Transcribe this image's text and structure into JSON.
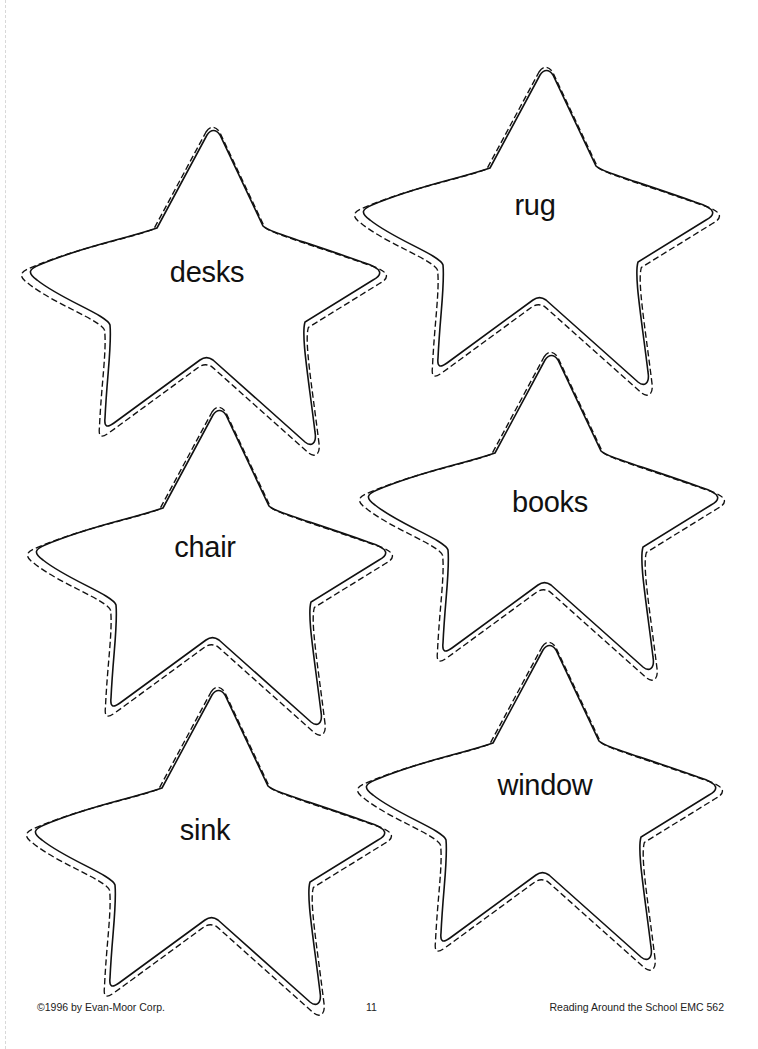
{
  "worksheet": {
    "stars": [
      {
        "word": "desks",
        "tip": [
          207,
          135
        ],
        "label_pos": [
          207,
          272
        ]
      },
      {
        "word": "rug",
        "tip": [
          540,
          75
        ],
        "label_pos": [
          535,
          205
        ]
      },
      {
        "word": "chair",
        "tip": [
          213,
          415
        ],
        "label_pos": [
          205,
          547
        ]
      },
      {
        "word": "books",
        "tip": [
          545,
          360
        ],
        "label_pos": [
          550,
          502
        ]
      },
      {
        "word": "sink",
        "tip": [
          212,
          695
        ],
        "label_pos": [
          205,
          830
        ]
      },
      {
        "word": "window",
        "tip": [
          543,
          650
        ],
        "label_pos": [
          545,
          785
        ]
      }
    ]
  },
  "footer": {
    "copyright": "©1996 by Evan-Moor Corp.",
    "page_number": "11",
    "book_title": "Reading Around the School EMC 562"
  },
  "colors": {
    "outline": "#111111",
    "background": "#ffffff"
  }
}
